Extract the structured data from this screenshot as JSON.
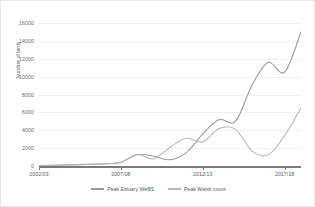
{
  "chart_data": {
    "type": "line",
    "title": "",
    "xlabel": "",
    "ylabel": "Number of birds",
    "ylim": [
      0,
      16000
    ],
    "ytick_labels": [
      "16000",
      "14000",
      "12000",
      "10000",
      "8000",
      "6000",
      "4000",
      "2000",
      "0"
    ],
    "ytick_values": [
      16000,
      14000,
      12000,
      10000,
      8000,
      6000,
      4000,
      2000,
      0
    ],
    "grid": true,
    "legend_position": "bottom",
    "x": [
      "2002/03",
      "2003/04",
      "2004/05",
      "2005/06",
      "2006/07",
      "2007/08",
      "2008/09",
      "2009/10",
      "2010/11",
      "2011/12",
      "2012/13",
      "2013/14",
      "2014/15",
      "2015/16",
      "2016/17",
      "2017/18",
      "2018/19"
    ],
    "xtick_labels": [
      "2002/03",
      "2007/08",
      "2012/13",
      "2017/18"
    ],
    "xtick_indices": [
      0,
      5,
      10,
      15
    ],
    "series": [
      {
        "name": "Peak Estuary WeBS",
        "color": "#9a9a9a",
        "values": [
          60,
          90,
          140,
          200,
          260,
          430,
          1250,
          1100,
          700,
          1500,
          3600,
          5200,
          5000,
          9000,
          11600,
          10500,
          15000
        ]
      },
      {
        "name": "Peak Welsh count",
        "color": "#b6b6b6",
        "values": [
          50,
          70,
          110,
          170,
          230,
          400,
          1300,
          800,
          2100,
          3100,
          2700,
          4200,
          4100,
          1700,
          1250,
          3400,
          6500
        ]
      }
    ]
  },
  "legend": {
    "items": [
      {
        "label": "Peak Estuary WeBS",
        "color": "#9a9a9a"
      },
      {
        "label": "Peak Welsh count",
        "color": "#b6b6b6"
      }
    ]
  }
}
